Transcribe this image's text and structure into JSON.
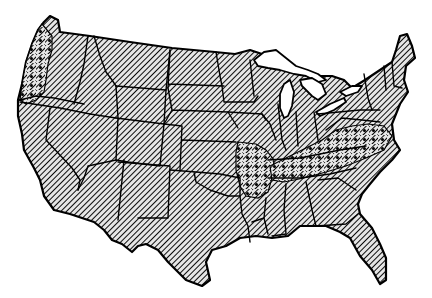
{
  "map": {
    "subject": "Contiguous United States",
    "style": "black-and-white line map",
    "colors": {
      "background": "#ffffff",
      "ink": "#000000",
      "hatch_bg": "#d8d8d8"
    },
    "patterns": [
      {
        "name": "diagonal-hatch",
        "covers": "all states (base fill)"
      },
      {
        "name": "stipple-dots",
        "covers": "highlighted regions overlaid on hatch"
      }
    ],
    "highlighted_regions": [
      {
        "id": "pacific-northwest-coast",
        "label": "Coastal Washington and Oregon",
        "pattern": "stipple-dots"
      },
      {
        "id": "ozarks",
        "label": "Arkansas / southern Missouri",
        "pattern": "stipple-dots"
      },
      {
        "id": "appalachia",
        "label": "Kentucky, Tennessee, Virginia, North Carolina, West Virginia",
        "pattern": "stipple-dots"
      }
    ],
    "water_features": [
      "Lake Superior",
      "Lake Michigan",
      "Lake Huron",
      "Lake Erie",
      "Lake Ontario"
    ]
  }
}
